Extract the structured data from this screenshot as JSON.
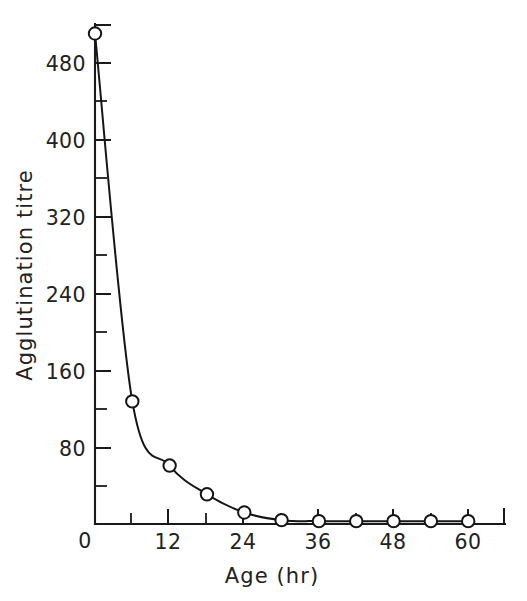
{
  "chart_data": {
    "type": "line",
    "title": "",
    "xlabel": "Age (hr)",
    "ylabel": "Agglutination titre",
    "xlim": [
      0,
      64
    ],
    "ylim": [
      0,
      520
    ],
    "grid": false,
    "legend": "none",
    "marker": "open-circle",
    "x": [
      0,
      6,
      12,
      18,
      24,
      30,
      36,
      42,
      48,
      54,
      60
    ],
    "values": [
      512,
      128,
      61,
      31,
      12,
      4,
      3,
      3,
      3,
      3,
      3
    ],
    "series": [
      {
        "name": "Agglutination titre",
        "x": [
          0,
          6,
          12,
          18,
          24,
          30,
          36,
          42,
          48,
          54,
          60
        ],
        "values": [
          512,
          128,
          61,
          31,
          12,
          4,
          3,
          3,
          3,
          3,
          3
        ]
      }
    ],
    "x_ticks_major": [
      0,
      12,
      24,
      36,
      48,
      60
    ],
    "x_ticks_minor": [
      6,
      18,
      30,
      42,
      54
    ],
    "x_tick_labels": [
      "0",
      "12",
      "24",
      "36",
      "48",
      "60"
    ],
    "y_ticks_major": [
      0,
      80,
      160,
      240,
      320,
      400,
      480
    ],
    "y_ticks_minor": [
      40,
      120,
      200,
      280,
      360,
      440
    ],
    "y_tick_labels": [
      "0",
      "80",
      "160",
      "240",
      "320",
      "400",
      "480"
    ],
    "colors": {
      "axis": "#1a1a1a",
      "curve": "#151515",
      "marker_fill": "#ffffff",
      "marker_stroke": "#151515",
      "background": "#ffffff",
      "text": "#222222"
    }
  }
}
